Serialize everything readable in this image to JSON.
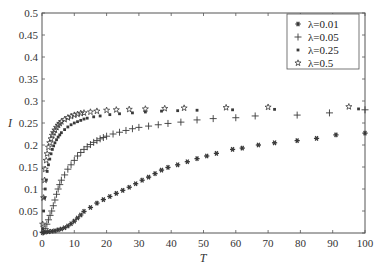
{
  "chart_data": {
    "type": "scatter",
    "title": "",
    "xlabel": "T",
    "ylabel": "I",
    "xlim": [
      0,
      100
    ],
    "ylim": [
      0,
      0.5
    ],
    "xticks": [
      0,
      10,
      20,
      30,
      40,
      50,
      60,
      70,
      80,
      90,
      100
    ],
    "yticks": [
      0,
      0.05,
      0.1,
      0.15,
      0.2,
      0.25,
      0.3,
      0.35,
      0.4,
      0.45,
      0.5
    ],
    "xtick_labels": [
      "0",
      "10",
      "20",
      "30",
      "40",
      "50",
      "60",
      "70",
      "80",
      "90",
      "100"
    ],
    "ytick_labels": [
      "0",
      "0.05",
      "0.1",
      "0.15",
      "0.2",
      "0.25",
      "0.3",
      "0.35",
      "0.4",
      "0.45",
      "0.5"
    ],
    "grid": false,
    "legend_position": "upper right",
    "series": [
      {
        "name": "λ=0.01",
        "marker": "asterisk",
        "points": [
          [
            0.2,
            0.001
          ],
          [
            1,
            0.002
          ],
          [
            2,
            0.003
          ],
          [
            3,
            0.004
          ],
          [
            4,
            0.005
          ],
          [
            5,
            0.007
          ],
          [
            6,
            0.009
          ],
          [
            7,
            0.012
          ],
          [
            8,
            0.016
          ],
          [
            9,
            0.021
          ],
          [
            10,
            0.027
          ],
          [
            11,
            0.034
          ],
          [
            12,
            0.041
          ],
          [
            13,
            0.049
          ],
          [
            15,
            0.058
          ],
          [
            17,
            0.068
          ],
          [
            19,
            0.076
          ],
          [
            21,
            0.083
          ],
          [
            23,
            0.09
          ],
          [
            25,
            0.097
          ],
          [
            27,
            0.104
          ],
          [
            29,
            0.112
          ],
          [
            31,
            0.12
          ],
          [
            33,
            0.127
          ],
          [
            35,
            0.135
          ],
          [
            37,
            0.143
          ],
          [
            39,
            0.149
          ],
          [
            42,
            0.155
          ],
          [
            45,
            0.162
          ],
          [
            48,
            0.169
          ],
          [
            51,
            0.175
          ],
          [
            54,
            0.181
          ],
          [
            59,
            0.19
          ],
          [
            62,
            0.193
          ],
          [
            67,
            0.2
          ],
          [
            72,
            0.205
          ],
          [
            79,
            0.21
          ],
          [
            85,
            0.215
          ],
          [
            91,
            0.223
          ],
          [
            100,
            0.227
          ]
        ]
      },
      {
        "name": "λ=0.05",
        "marker": "plus",
        "points": [
          [
            0.3,
            0.002
          ],
          [
            1,
            0.01
          ],
          [
            1.5,
            0.02
          ],
          [
            2,
            0.03
          ],
          [
            2.5,
            0.04
          ],
          [
            3,
            0.05
          ],
          [
            3.5,
            0.062
          ],
          [
            4,
            0.075
          ],
          [
            4.5,
            0.088
          ],
          [
            5,
            0.1
          ],
          [
            5.5,
            0.11
          ],
          [
            6,
            0.12
          ],
          [
            7,
            0.132
          ],
          [
            8,
            0.145
          ],
          [
            9,
            0.155
          ],
          [
            10,
            0.165
          ],
          [
            11,
            0.175
          ],
          [
            12,
            0.183
          ],
          [
            13,
            0.19
          ],
          [
            14,
            0.196
          ],
          [
            15,
            0.201
          ],
          [
            16,
            0.206
          ],
          [
            17,
            0.21
          ],
          [
            18,
            0.214
          ],
          [
            19,
            0.217
          ],
          [
            20,
            0.22
          ],
          [
            22,
            0.225
          ],
          [
            24,
            0.229
          ],
          [
            26,
            0.233
          ],
          [
            28,
            0.237
          ],
          [
            30,
            0.24
          ],
          [
            33,
            0.243
          ],
          [
            36,
            0.246
          ],
          [
            39,
            0.249
          ],
          [
            43,
            0.252
          ],
          [
            48,
            0.257
          ],
          [
            53,
            0.26
          ],
          [
            60,
            0.262
          ],
          [
            66,
            0.266
          ],
          [
            79,
            0.268
          ],
          [
            89,
            0.273
          ],
          [
            100,
            0.28
          ]
        ]
      },
      {
        "name": "λ=0.25",
        "marker": "square",
        "points": [
          [
            0.2,
            0.01
          ],
          [
            0.5,
            0.05
          ],
          [
            0.8,
            0.08
          ],
          [
            1,
            0.1
          ],
          [
            1.3,
            0.12
          ],
          [
            1.6,
            0.14
          ],
          [
            2,
            0.155
          ],
          [
            2.4,
            0.168
          ],
          [
            2.8,
            0.18
          ],
          [
            3.2,
            0.19
          ],
          [
            3.6,
            0.198
          ],
          [
            4,
            0.205
          ],
          [
            4.5,
            0.212
          ],
          [
            5,
            0.218
          ],
          [
            5.5,
            0.223
          ],
          [
            6,
            0.228
          ],
          [
            7,
            0.235
          ],
          [
            8,
            0.241
          ],
          [
            9,
            0.246
          ],
          [
            10,
            0.25
          ],
          [
            11,
            0.253
          ],
          [
            12,
            0.256
          ],
          [
            13,
            0.259
          ],
          [
            14,
            0.261
          ],
          [
            16,
            0.264
          ],
          [
            18,
            0.266
          ],
          [
            21,
            0.269
          ],
          [
            24,
            0.271
          ],
          [
            28,
            0.273
          ],
          [
            32,
            0.275
          ],
          [
            37,
            0.277
          ],
          [
            42,
            0.278
          ],
          [
            48,
            0.279
          ],
          [
            59,
            0.28
          ],
          [
            72,
            0.281
          ],
          [
            98,
            0.282
          ]
        ]
      },
      {
        "name": "λ=0.5",
        "marker": "star",
        "points": [
          [
            0.2,
            0.02
          ],
          [
            0.5,
            0.08
          ],
          [
            0.8,
            0.12
          ],
          [
            1,
            0.145
          ],
          [
            1.3,
            0.165
          ],
          [
            1.6,
            0.18
          ],
          [
            2,
            0.195
          ],
          [
            2.4,
            0.205
          ],
          [
            2.8,
            0.214
          ],
          [
            3.2,
            0.222
          ],
          [
            3.6,
            0.228
          ],
          [
            4,
            0.234
          ],
          [
            4.5,
            0.24
          ],
          [
            5,
            0.245
          ],
          [
            5.5,
            0.249
          ],
          [
            6,
            0.253
          ],
          [
            7,
            0.258
          ],
          [
            8,
            0.262
          ],
          [
            9,
            0.265
          ],
          [
            10,
            0.268
          ],
          [
            11,
            0.27
          ],
          [
            12,
            0.272
          ],
          [
            13,
            0.273
          ],
          [
            15,
            0.275
          ],
          [
            17,
            0.277
          ],
          [
            20,
            0.279
          ],
          [
            23,
            0.28
          ],
          [
            27,
            0.281
          ],
          [
            32,
            0.282
          ],
          [
            38,
            0.283
          ],
          [
            44,
            0.284
          ],
          [
            57,
            0.285
          ],
          [
            70,
            0.286
          ],
          [
            95,
            0.287
          ]
        ]
      }
    ]
  },
  "legend": {
    "items": [
      {
        "label": "λ=0.01",
        "marker": "asterisk"
      },
      {
        "label": "λ=0.05",
        "marker": "plus"
      },
      {
        "label": "λ=0.25",
        "marker": "square"
      },
      {
        "label": "λ=0.5",
        "marker": "star"
      }
    ]
  },
  "colors": {
    "marker": "#3a3a3a",
    "axis": "#555555",
    "text": "#333333"
  }
}
